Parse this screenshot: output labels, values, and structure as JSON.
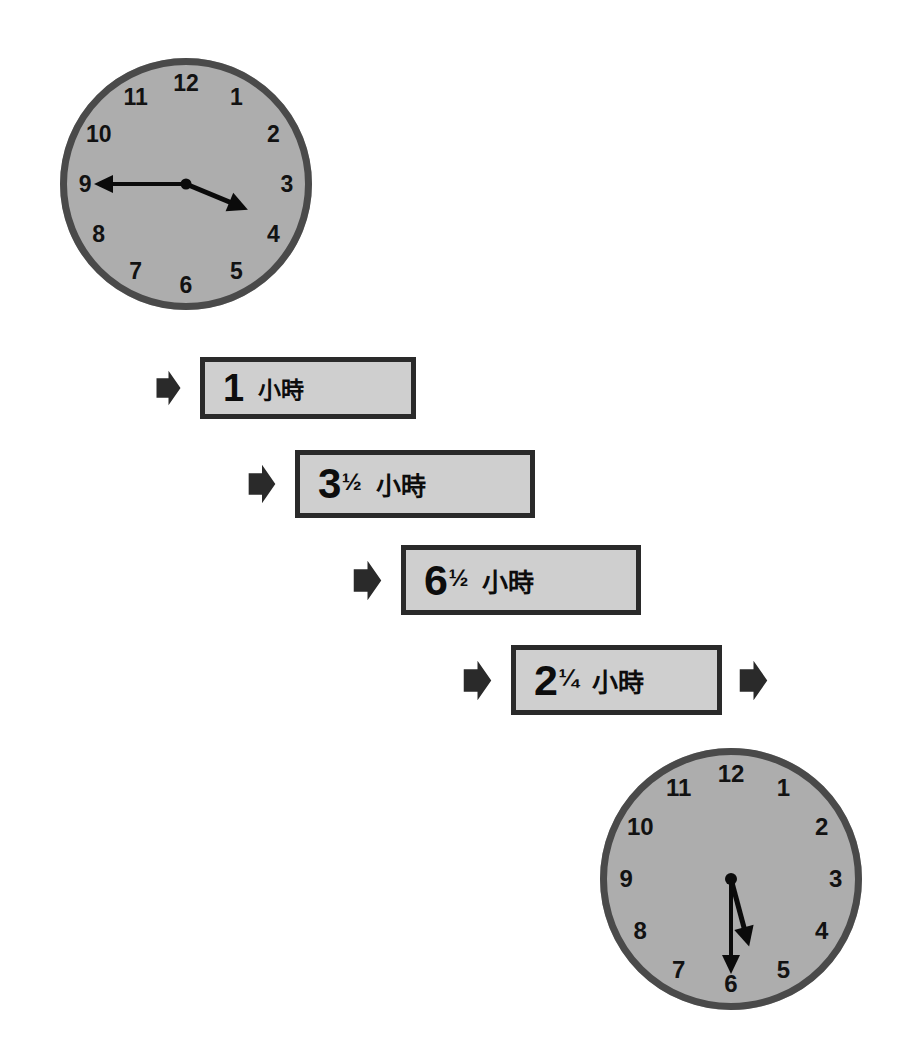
{
  "page": {
    "background_color": "#ffffff",
    "width": 905,
    "height": 1064
  },
  "colors": {
    "clock_face": "#adadad",
    "clock_rim": "#4a4a4a",
    "hand": "#0b0b0b",
    "box_fill": "#cfcfcf",
    "box_border": "#2a2a2a",
    "arrow": "#2a2a2a",
    "numeral": "#121212"
  },
  "clocks": [
    {
      "id": "start-clock",
      "name": "start-time-clock",
      "time_text": "3:45",
      "hour_hand_value": 3.75,
      "minute_hand_value": 45,
      "numerals": [
        "12",
        "1",
        "2",
        "3",
        "4",
        "5",
        "6",
        "7",
        "8",
        "9",
        "10",
        "11"
      ],
      "x": 60,
      "y": 58,
      "size": 252
    },
    {
      "id": "end-clock",
      "name": "end-time-clock",
      "time_text": "5:30",
      "hour_hand_value": 5.5,
      "minute_hand_value": 30,
      "numerals": [
        "12",
        "1",
        "2",
        "3",
        "4",
        "5",
        "6",
        "7",
        "8",
        "9",
        "10",
        "11"
      ],
      "x": 600,
      "y": 748,
      "size": 262
    }
  ],
  "durations": [
    {
      "id": "duration-1",
      "whole": "1",
      "fraction": "",
      "unit": "小時",
      "full_text": "1 小時",
      "x": 200,
      "y": 357,
      "width": 216,
      "height": 62,
      "left_arrow": true,
      "right_arrow": false
    },
    {
      "id": "duration-2",
      "whole": "3",
      "fraction": "½",
      "unit": "小時",
      "full_text": "3½ 小時",
      "x": 295,
      "y": 450,
      "width": 240,
      "height": 68,
      "left_arrow": true,
      "right_arrow": false
    },
    {
      "id": "duration-3",
      "whole": "6",
      "fraction": "½",
      "unit": "小時",
      "full_text": "6½ 小時",
      "x": 401,
      "y": 545,
      "width": 240,
      "height": 70,
      "left_arrow": true,
      "right_arrow": false
    },
    {
      "id": "duration-4",
      "whole": "2",
      "fraction": "¼",
      "unit": "小時",
      "full_text": "2¼ 小時",
      "x": 511,
      "y": 645,
      "width": 211,
      "height": 70,
      "left_arrow": true,
      "right_arrow": true
    }
  ]
}
